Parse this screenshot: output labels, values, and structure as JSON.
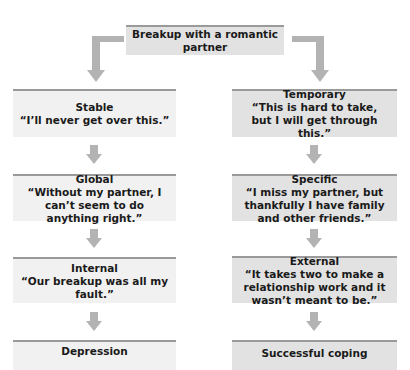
{
  "diagram": {
    "root": {
      "label": "Breakup with a romantic partner"
    },
    "colors": {
      "left_box": "#f1f1f1",
      "right_box": "#e2e2e2",
      "box_top_border": "#9a9a9a",
      "arrow": "#b3b3b3"
    },
    "left_path": [
      {
        "title": "Stable",
        "quote": "“I’ll never get over this.”"
      },
      {
        "title": "Global",
        "quote": "“Without my partner, I can’t seem to do anything right.”"
      },
      {
        "title": "Internal",
        "quote": "“Our breakup was all my fault.”"
      },
      {
        "title": "Depression",
        "quote": ""
      }
    ],
    "right_path": [
      {
        "title": "Temporary",
        "quote": "“This is hard to take, but I will get through this.”"
      },
      {
        "title": "Specific",
        "quote": "“I miss my partner, but thankfully I have family and other friends.”"
      },
      {
        "title": "External",
        "quote": "“It takes two to make a relationship work and it wasn’t meant to be.”"
      },
      {
        "title": "Successful coping",
        "quote": ""
      }
    ]
  }
}
